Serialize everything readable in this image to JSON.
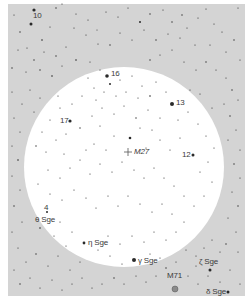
{
  "chart": {
    "background_color": "#ffffff",
    "sky_color": "#d4d4d4",
    "field_color": "#ffffff",
    "star_color": "#2a2a2a",
    "sky_rect": {
      "x": 8,
      "y": 4,
      "w": 237,
      "h": 292
    },
    "field_of_view": {
      "cx": 124,
      "cy": 167,
      "r": 100
    }
  },
  "labels": [
    {
      "id": "10",
      "text": "10",
      "x": 33,
      "y": 12,
      "italic": false
    },
    {
      "id": "16",
      "text": "16",
      "x": 111,
      "y": 70,
      "italic": false
    },
    {
      "id": "13",
      "text": "13",
      "x": 176,
      "y": 99,
      "italic": false
    },
    {
      "id": "17",
      "text": "17",
      "x": 60,
      "y": 117,
      "italic": false
    },
    {
      "id": "m27",
      "text": "M27",
      "x": 134,
      "y": 148,
      "italic": true
    },
    {
      "id": "12",
      "text": "12",
      "x": 182,
      "y": 151,
      "italic": false
    },
    {
      "id": "4",
      "text": "4",
      "x": 44,
      "y": 204,
      "italic": false
    },
    {
      "id": "theta-sge",
      "text": "θ Sge",
      "x": 35,
      "y": 216,
      "italic": false
    },
    {
      "id": "eta-sge",
      "text": "η Sge",
      "x": 88,
      "y": 239,
      "italic": false
    },
    {
      "id": "gamma-sge",
      "text": "γ Sge",
      "x": 138,
      "y": 257,
      "italic": false
    },
    {
      "id": "zeta-sge",
      "text": "ζ Sge",
      "x": 199,
      "y": 258,
      "italic": false
    },
    {
      "id": "m71",
      "text": "M71",
      "x": 167,
      "y": 272,
      "italic": false
    },
    {
      "id": "delta-sge",
      "text": "δ Sge",
      "x": 206,
      "y": 288,
      "italic": false
    }
  ],
  "objects": {
    "m27_marker": {
      "x": 128,
      "y": 152,
      "size": 4
    },
    "m71_marker": {
      "x": 175,
      "y": 289,
      "size": 3
    }
  },
  "stars": [
    [
      34,
      10,
      1.6
    ],
    [
      31,
      24,
      1.5
    ],
    [
      56,
      8,
      0.7
    ],
    [
      62,
      4,
      0.6
    ],
    [
      14,
      15,
      0.6
    ],
    [
      20,
      32,
      0.7
    ],
    [
      42,
      40,
      0.8
    ],
    [
      27,
      48,
      0.6
    ],
    [
      50,
      27,
      0.6
    ],
    [
      76,
      14,
      0.6
    ],
    [
      88,
      20,
      0.6
    ],
    [
      97,
      30,
      0.5
    ],
    [
      106,
      12,
      0.6
    ],
    [
      118,
      17,
      0.6
    ],
    [
      128,
      8,
      0.6
    ],
    [
      140,
      22,
      1.0
    ],
    [
      150,
      14,
      0.7
    ],
    [
      163,
      10,
      0.6
    ],
    [
      172,
      22,
      0.7
    ],
    [
      182,
      15,
      0.7
    ],
    [
      187,
      28,
      0.6
    ],
    [
      198,
      18,
      0.6
    ],
    [
      206,
      9,
      0.6
    ],
    [
      214,
      24,
      0.6
    ],
    [
      222,
      32,
      0.6
    ],
    [
      238,
      8,
      0.6
    ],
    [
      234,
      40,
      0.7
    ],
    [
      226,
      52,
      0.6
    ],
    [
      240,
      60,
      0.6
    ],
    [
      210,
      45,
      0.6
    ],
    [
      195,
      45,
      0.6
    ],
    [
      180,
      38,
      0.6
    ],
    [
      168,
      34,
      0.6
    ],
    [
      156,
      40,
      0.7
    ],
    [
      144,
      30,
      0.6
    ],
    [
      132,
      40,
      0.6
    ],
    [
      120,
      33,
      0.6
    ],
    [
      110,
      45,
      0.7
    ],
    [
      98,
      44,
      0.6
    ],
    [
      86,
      35,
      0.6
    ],
    [
      74,
      28,
      0.6
    ],
    [
      66,
      47,
      0.6
    ],
    [
      56,
      56,
      0.7
    ],
    [
      44,
      52,
      0.6
    ],
    [
      34,
      60,
      0.7
    ],
    [
      18,
      50,
      0.6
    ],
    [
      12,
      68,
      0.7
    ],
    [
      26,
      72,
      0.6
    ],
    [
      40,
      70,
      0.7
    ],
    [
      52,
      76,
      0.8
    ],
    [
      62,
      66,
      0.6
    ],
    [
      76,
      60,
      0.8
    ],
    [
      90,
      62,
      0.6
    ],
    [
      100,
      70,
      0.6
    ],
    [
      150,
      60,
      0.7
    ],
    [
      160,
      55,
      0.6
    ],
    [
      172,
      50,
      0.6
    ],
    [
      184,
      62,
      0.6
    ],
    [
      196,
      70,
      0.6
    ],
    [
      206,
      62,
      0.7
    ],
    [
      216,
      70,
      0.6
    ],
    [
      226,
      78,
      0.6
    ],
    [
      232,
      90,
      0.7
    ],
    [
      238,
      100,
      0.6
    ],
    [
      224,
      104,
      0.6
    ],
    [
      230,
      116,
      0.7
    ],
    [
      236,
      130,
      0.6
    ],
    [
      228,
      140,
      0.6
    ],
    [
      240,
      150,
      0.6
    ],
    [
      234,
      164,
      0.7
    ],
    [
      240,
      178,
      0.6
    ],
    [
      232,
      192,
      0.6
    ],
    [
      238,
      206,
      0.7
    ],
    [
      228,
      218,
      0.6
    ],
    [
      236,
      232,
      0.6
    ],
    [
      226,
      244,
      0.7
    ],
    [
      238,
      252,
      0.6
    ],
    [
      220,
      252,
      0.6
    ],
    [
      212,
      240,
      0.6
    ],
    [
      204,
      248,
      0.6
    ],
    [
      196,
      256,
      0.6
    ],
    [
      186,
      250,
      0.6
    ],
    [
      176,
      262,
      0.6
    ],
    [
      166,
      268,
      0.7
    ],
    [
      156,
      276,
      0.6
    ],
    [
      146,
      282,
      0.6
    ],
    [
      136,
      276,
      0.6
    ],
    [
      124,
      284,
      0.6
    ],
    [
      114,
      278,
      0.7
    ],
    [
      102,
      284,
      0.6
    ],
    [
      92,
      288,
      0.6
    ],
    [
      82,
      278,
      0.6
    ],
    [
      72,
      284,
      0.6
    ],
    [
      62,
      290,
      0.6
    ],
    [
      52,
      280,
      0.6
    ],
    [
      40,
      288,
      0.6
    ],
    [
      30,
      278,
      0.6
    ],
    [
      20,
      284,
      0.7
    ],
    [
      14,
      270,
      0.6
    ],
    [
      26,
      262,
      0.6
    ],
    [
      36,
      254,
      0.7
    ],
    [
      48,
      266,
      0.6
    ],
    [
      58,
      256,
      0.6
    ],
    [
      70,
      270,
      0.6
    ],
    [
      80,
      262,
      0.6
    ],
    [
      18,
      248,
      0.6
    ],
    [
      12,
      232,
      0.6
    ],
    [
      22,
      222,
      0.6
    ],
    [
      14,
      206,
      0.7
    ],
    [
      20,
      190,
      0.6
    ],
    [
      12,
      176,
      0.6
    ],
    [
      18,
      160,
      0.8
    ],
    [
      12,
      146,
      0.6
    ],
    [
      20,
      132,
      0.6
    ],
    [
      14,
      118,
      0.6
    ],
    [
      22,
      104,
      0.6
    ],
    [
      12,
      92,
      0.6
    ],
    [
      30,
      90,
      0.6
    ],
    [
      40,
      98,
      0.6
    ],
    [
      34,
      112,
      0.6
    ],
    [
      188,
      276,
      0.6
    ],
    [
      198,
      284,
      0.6
    ],
    [
      208,
      276,
      0.6
    ],
    [
      220,
      282,
      0.6
    ],
    [
      230,
      270,
      0.6
    ],
    [
      240,
      284,
      0.6
    ],
    [
      196,
      266,
      0.6
    ],
    [
      107,
      76,
      1.8
    ],
    [
      110,
      84,
      1.0
    ],
    [
      172,
      104,
      2.0
    ],
    [
      70,
      121,
      1.6
    ],
    [
      193,
      155,
      1.5
    ],
    [
      130,
      138,
      1.3
    ],
    [
      84,
      243,
      1.4
    ],
    [
      134,
      260,
      2.0
    ],
    [
      210,
      270,
      1.5
    ],
    [
      228,
      292,
      1.5
    ],
    [
      47,
      212,
      1.0
    ],
    [
      40,
      228,
      0.8
    ],
    [
      120,
      80,
      0.6
    ],
    [
      132,
      76,
      0.6
    ],
    [
      142,
      86,
      0.6
    ],
    [
      156,
      82,
      0.6
    ],
    [
      166,
      92,
      0.6
    ],
    [
      150,
      96,
      0.8
    ],
    [
      138,
      98,
      0.6
    ],
    [
      126,
      92,
      0.6
    ],
    [
      116,
      96,
      0.6
    ],
    [
      104,
      92,
      0.6
    ],
    [
      94,
      88,
      0.6
    ],
    [
      82,
      96,
      0.6
    ],
    [
      72,
      104,
      0.6
    ],
    [
      60,
      108,
      0.6
    ],
    [
      50,
      120,
      0.6
    ],
    [
      42,
      132,
      0.6
    ],
    [
      36,
      146,
      0.7
    ],
    [
      46,
      152,
      0.6
    ],
    [
      56,
      140,
      0.6
    ],
    [
      66,
      134,
      0.6
    ],
    [
      80,
      128,
      0.7
    ],
    [
      92,
      116,
      0.6
    ],
    [
      102,
      108,
      0.6
    ],
    [
      114,
      114,
      0.6
    ],
    [
      124,
      106,
      0.6
    ],
    [
      136,
      118,
      0.7
    ],
    [
      148,
      110,
      0.6
    ],
    [
      160,
      118,
      0.6
    ],
    [
      178,
      120,
      0.6
    ],
    [
      188,
      112,
      0.6
    ],
    [
      198,
      124,
      0.6
    ],
    [
      206,
      136,
      0.6
    ],
    [
      214,
      148,
      0.6
    ],
    [
      208,
      162,
      0.6
    ],
    [
      200,
      172,
      0.6
    ],
    [
      212,
      182,
      0.6
    ],
    [
      204,
      196,
      0.6
    ],
    [
      194,
      206,
      0.6
    ],
    [
      184,
      196,
      0.6
    ],
    [
      174,
      186,
      0.6
    ],
    [
      164,
      178,
      0.6
    ],
    [
      154,
      168,
      0.6
    ],
    [
      144,
      178,
      0.6
    ],
    [
      134,
      170,
      0.6
    ],
    [
      122,
      162,
      0.6
    ],
    [
      112,
      172,
      0.6
    ],
    [
      100,
      164,
      0.6
    ],
    [
      90,
      174,
      0.6
    ],
    [
      80,
      160,
      0.6
    ],
    [
      70,
      168,
      0.6
    ],
    [
      60,
      178,
      0.6
    ],
    [
      48,
      170,
      0.6
    ],
    [
      38,
      184,
      0.6
    ],
    [
      50,
      194,
      0.6
    ],
    [
      62,
      200,
      0.6
    ],
    [
      74,
      190,
      0.6
    ],
    [
      86,
      198,
      0.6
    ],
    [
      96,
      208,
      0.6
    ],
    [
      108,
      196,
      0.6
    ],
    [
      118,
      206,
      0.6
    ],
    [
      128,
      196,
      0.6
    ],
    [
      140,
      204,
      0.6
    ],
    [
      152,
      212,
      0.6
    ],
    [
      162,
      204,
      0.6
    ],
    [
      172,
      214,
      0.6
    ],
    [
      184,
      222,
      0.6
    ],
    [
      176,
      232,
      0.6
    ],
    [
      166,
      240,
      0.6
    ],
    [
      154,
      232,
      0.6
    ],
    [
      144,
      242,
      0.6
    ],
    [
      132,
      236,
      0.6
    ],
    [
      120,
      244,
      0.6
    ],
    [
      108,
      236,
      0.6
    ],
    [
      98,
      250,
      0.6
    ],
    [
      72,
      232,
      0.6
    ],
    [
      60,
      222,
      0.6
    ],
    [
      54,
      236,
      0.6
    ],
    [
      66,
      246,
      0.6
    ],
    [
      110,
      256,
      0.6
    ],
    [
      122,
      264,
      0.6
    ],
    [
      150,
      254,
      0.6
    ],
    [
      160,
      258,
      0.6
    ],
    [
      146,
      148,
      0.6
    ],
    [
      160,
      140,
      0.6
    ],
    [
      170,
      150,
      0.6
    ],
    [
      180,
      138,
      0.6
    ],
    [
      94,
      144,
      0.6
    ],
    [
      106,
      150,
      0.6
    ],
    [
      114,
      136,
      0.6
    ],
    [
      86,
      150,
      0.6
    ],
    [
      64,
      154,
      0.6
    ],
    [
      140,
      128,
      0.6
    ],
    [
      152,
      130,
      0.6
    ],
    [
      100,
      126,
      0.6
    ],
    [
      58,
      96,
      0.6
    ],
    [
      200,
      94,
      0.6
    ],
    [
      212,
      108,
      0.6
    ],
    [
      190,
      90,
      0.6
    ],
    [
      88,
      78,
      0.6
    ],
    [
      96,
      100,
      0.6
    ]
  ]
}
